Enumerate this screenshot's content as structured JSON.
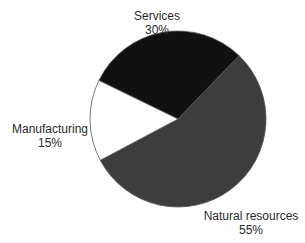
{
  "chart_data": {
    "type": "pie",
    "title": "",
    "categories": [
      "Services",
      "Natural resources",
      "Manufacturing"
    ],
    "values": [
      30,
      55,
      15
    ],
    "unit": "%",
    "colors": [
      "#111111",
      "#3d3d3d",
      "#ffffff"
    ],
    "start_angle_deg": -30,
    "direction": "clockwise",
    "labels": [
      {
        "name": "Services",
        "value": "30%"
      },
      {
        "name": "Natural resources",
        "value": "55%"
      },
      {
        "name": "Manufacturing",
        "value": "15%"
      }
    ],
    "legend": "none (direct labels)"
  }
}
